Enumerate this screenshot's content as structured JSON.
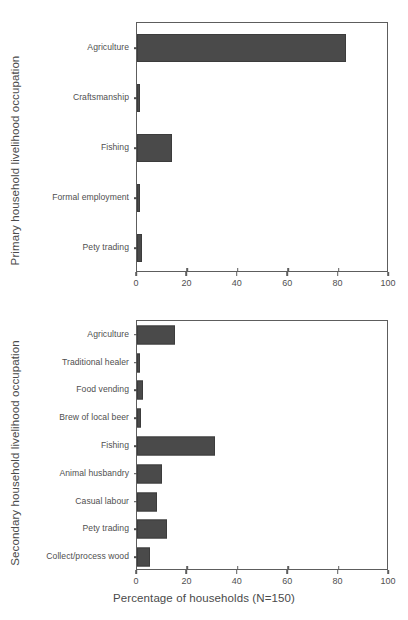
{
  "figure": {
    "xaxis_label": "Percentage of households (N=150)",
    "bar_color": "#4a4a4a",
    "frame_color": "#5d5d5d",
    "text_color": "#4a4a4a"
  },
  "chart_data": [
    {
      "type": "bar",
      "orientation": "horizontal",
      "title": "",
      "ylabel": "Primary household livelihood occupation",
      "xlabel": "",
      "categories": [
        "Agriculture",
        "Craftsmanship",
        "Fishing",
        "Formal employment",
        "Pety trading"
      ],
      "values": [
        83,
        1,
        14,
        1,
        2
      ],
      "xlim": [
        0,
        100
      ],
      "xticks": [
        0,
        20,
        40,
        60,
        80,
        100
      ],
      "xticklabels": [
        "0",
        "20",
        "40",
        "60",
        "80",
        "100"
      ],
      "grid": false,
      "legend": false
    },
    {
      "type": "bar",
      "orientation": "horizontal",
      "title": "",
      "ylabel": "Secondary household livelihood occupation",
      "xlabel": "Percentage of households (N=150)",
      "categories": [
        "Agriculture",
        "Traditional healer",
        "Food vending",
        "Brew of local beer",
        "Fishing",
        "Animal husbandry",
        "Casual labour",
        "Pety trading",
        "Collect/process wood"
      ],
      "values": [
        15,
        1,
        2.5,
        1.5,
        31,
        10,
        8,
        12,
        5
      ],
      "xlim": [
        0,
        100
      ],
      "xticks": [
        0,
        20,
        40,
        60,
        80,
        100
      ],
      "xticklabels": [
        "0",
        "20",
        "40",
        "60",
        "80",
        "100"
      ],
      "grid": false,
      "legend": false
    }
  ]
}
